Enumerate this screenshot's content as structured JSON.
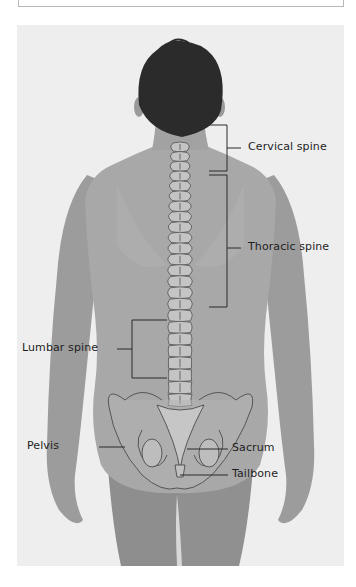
{
  "figure": {
    "labels": {
      "cervical": "Cervical spine",
      "thoracic": "Thoracic spine",
      "lumbar": "Lumbar spine",
      "pelvis": "Pelvis",
      "sacrum": "Sacrum",
      "tailbone": "Tailbone"
    },
    "colors": {
      "background": "#efefef",
      "skin": "#a9a9a9",
      "hair": "#2a2a2a",
      "bone_fill": "#c9c9c9",
      "outline": "#3a3a3a",
      "leader_line": "#2b2b2b"
    }
  }
}
